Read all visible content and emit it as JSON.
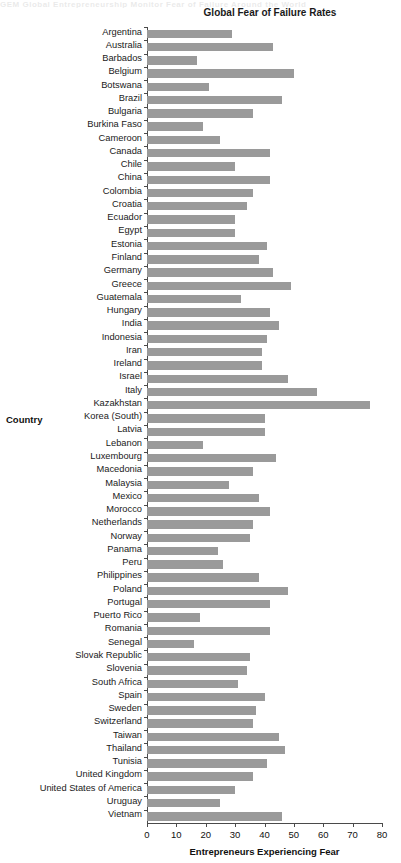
{
  "page": {
    "top_cutoff_text": "GEM  Global Entrepreneurship Monitor   Fear of Failure Around the World"
  },
  "chart_data": {
    "type": "bar",
    "orientation": "horizontal",
    "title": "Global Fear of Failure Rates",
    "xlabel": "Entrepreneurs Experiencing Fear",
    "ylabel": "Country",
    "xlim": [
      0,
      80
    ],
    "xticks": [
      0,
      10,
      20,
      30,
      40,
      50,
      60,
      70,
      80
    ],
    "grid": false,
    "legend": null,
    "bar_color": "#9a9a9a",
    "categories": [
      "Argentina",
      "Australia",
      "Barbados",
      "Belgium",
      "Botswana",
      "Brazil",
      "Bulgaria",
      "Burkina Faso",
      "Cameroon",
      "Canada",
      "Chile",
      "China",
      "Colombia",
      "Croatia",
      "Ecuador",
      "Egypt",
      "Estonia",
      "Finland",
      "Germany",
      "Greece",
      "Guatemala",
      "Hungary",
      "India",
      "Indonesia",
      "Iran",
      "Ireland",
      "Israel",
      "Italy",
      "Kazakhstan",
      "Korea (South)",
      "Latvia",
      "Lebanon",
      "Luxembourg",
      "Macedonia",
      "Malaysia",
      "Mexico",
      "Morocco",
      "Netherlands",
      "Norway",
      "Panama",
      "Peru",
      "Philippines",
      "Poland",
      "Portugal",
      "Puerto Rico",
      "Romania",
      "Senegal",
      "Slovak Republic",
      "Slovenia",
      "South Africa",
      "Spain",
      "Sweden",
      "Switzerland",
      "Taiwan",
      "Thailand",
      "Tunisia",
      "United Kingdom",
      "United States of America",
      "Uruguay",
      "Vietnam"
    ],
    "values": [
      29,
      43,
      17,
      50,
      21,
      46,
      36,
      19,
      25,
      42,
      30,
      42,
      36,
      34,
      30,
      30,
      41,
      38,
      43,
      49,
      32,
      42,
      45,
      41,
      39,
      39,
      48,
      58,
      76,
      40,
      40,
      19,
      44,
      36,
      28,
      38,
      42,
      36,
      35,
      24,
      26,
      38,
      48,
      42,
      18,
      42,
      16,
      35,
      34,
      31,
      40,
      37,
      36,
      45,
      47,
      41,
      36,
      30,
      25,
      46
    ]
  }
}
